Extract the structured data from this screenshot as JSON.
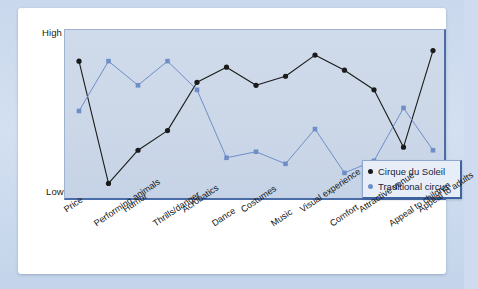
{
  "axis": {
    "y_high_label": "High",
    "y_low_label": "Low"
  },
  "legend": {
    "position": "bottom-right",
    "items": [
      {
        "label": "Cirque du Soleil",
        "color": "#1a1a1a"
      },
      {
        "label": "Traditional circus",
        "color": "#6f8ec7"
      }
    ]
  },
  "colors": {
    "cirque": "#1a1a1a",
    "traditional": "#6f8ec7",
    "plot_background": "#ccd8e8",
    "plot_border": "#4a6da8",
    "card_background": "#ffffff",
    "page_background": "#cfdcef"
  },
  "chart_data": {
    "type": "line",
    "title": "",
    "xlabel": "",
    "ylabel": "",
    "ylim": [
      0,
      100
    ],
    "grid": false,
    "ytick_labels": [
      "Low",
      "High"
    ],
    "legend_position": "bottom-right",
    "categories": [
      "Price",
      "Performing animals",
      "Humor",
      "Thrills/danger",
      "Acrobatics",
      "Dance",
      "Costumes",
      "Music",
      "Visual experience",
      "Comfort",
      "Attractive venue",
      "Appeal to children",
      "Appeal to adults"
    ],
    "series": [
      {
        "name": "Cirque du Soleil",
        "color": "#1a1a1a",
        "values": [
          86,
          5,
          27,
          40,
          72,
          82,
          70,
          76,
          90,
          80,
          67,
          29,
          93
        ]
      },
      {
        "name": "Traditional circus",
        "color": "#6f8ec7",
        "values": [
          53,
          86,
          70,
          86,
          67,
          22,
          26,
          18,
          41,
          12,
          20,
          55,
          27
        ]
      }
    ]
  }
}
